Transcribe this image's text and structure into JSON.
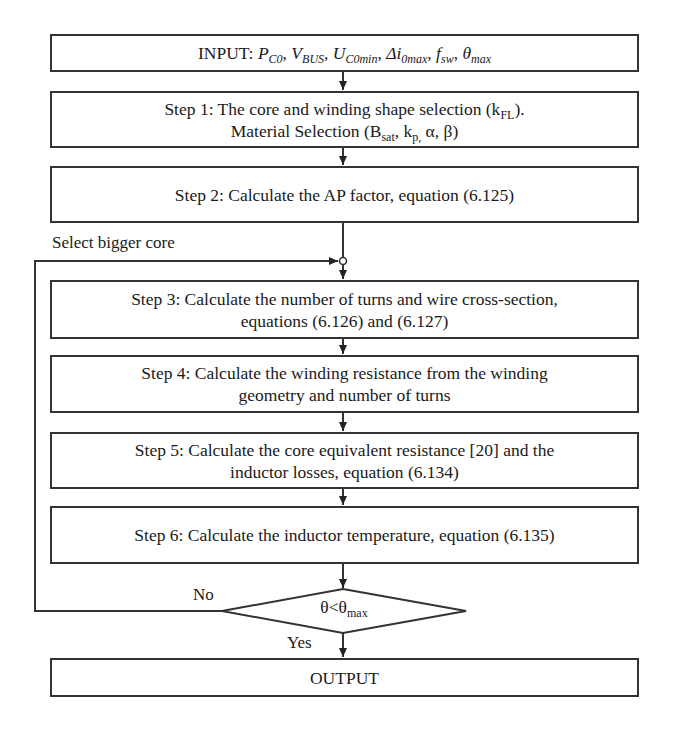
{
  "diagram": {
    "type": "flowchart",
    "input": {
      "prefix": "INPUT: ",
      "vars": [
        {
          "base": "P",
          "sub": "C0"
        },
        {
          "base": "V",
          "sub": "BUS"
        },
        {
          "base": "U",
          "sub": "C0min"
        },
        {
          "base": "Δi",
          "sub": "0max"
        },
        {
          "base": "f",
          "sub": "sw"
        },
        {
          "base": "θ",
          "sub": "max"
        }
      ],
      "text": "INPUT: P_C0, V_BUS, U_C0min, Δi_0max, f_sw, θ_max"
    },
    "step1": {
      "line1_a": "Step 1: The core and winding shape selection (k",
      "line1_sub": "FL",
      "line1_b": ").",
      "line2_a": "Material Selection (B",
      "line2_sub1": "sat",
      "line2_b": ", k",
      "line2_sub2": "p,",
      "line2_c": " α, β)"
    },
    "step2": {
      "text": "Step 2: Calculate the AP factor, equation (6.125)"
    },
    "loop_label": "Select bigger core",
    "step3": {
      "line1": "Step 3: Calculate the number of turns and wire cross-section,",
      "line2": "equations (6.126) and (6.127)"
    },
    "step4": {
      "line1": "Step 4: Calculate the winding resistance from the winding",
      "line2": "geometry and number of turns"
    },
    "step5": {
      "line1": "Step 5: Calculate the core equivalent resistance [20] and the",
      "line2": "inductor losses, equation (6.134)"
    },
    "step6": {
      "text": "Step 6: Calculate the inductor temperature, equation (6.135)"
    },
    "decision": {
      "cond_a": "θ<θ",
      "cond_sub": "max",
      "no_label": "No",
      "yes_label": "Yes"
    },
    "output": {
      "text": "OUTPUT"
    },
    "colors": {
      "stroke": "#333333",
      "text": "#1a1a1a",
      "background": "#ffffff"
    }
  }
}
